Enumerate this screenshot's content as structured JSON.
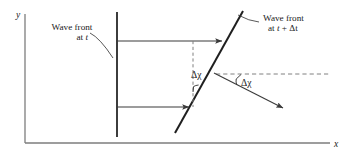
{
  "figure": {
    "kind": "physics-diagram",
    "background_color": "#ffffff",
    "line_color": "#3a3a3a",
    "dark_line_color": "#1a1a1a",
    "text_color": "#1a1a1a"
  },
  "axes": {
    "y_label": "y",
    "x_label": "x",
    "y_axis": {
      "x": 25,
      "y_top": 14,
      "y_bottom": 143
    },
    "x_axis": {
      "y": 143,
      "x_left": 25,
      "x_right": 330
    }
  },
  "labels": {
    "wavefront_t": {
      "line1": "Wave front",
      "line2_prefix": "at ",
      "line2_var": "t",
      "x": 73,
      "y": 30
    },
    "wavefront_t_dt": {
      "line1": "Wave front",
      "line2_prefix": "at ",
      "line2_var": "t",
      "line2_suffix": " + Δt",
      "x": 292,
      "y": 20
    },
    "angle_left": {
      "text": "Δχ",
      "x": 192,
      "y": 77
    },
    "angle_right": {
      "text": "Δχ",
      "x": 243,
      "y": 85
    }
  },
  "geometry": {
    "wavefront_vertical": {
      "x": 117,
      "y_top": 12,
      "y_bottom": 137
    },
    "wavefront_slanted": {
      "x1": 175,
      "y1": 133,
      "x2": 243,
      "y2": 11
    },
    "ray_upper": {
      "x1": 117,
      "y1": 41,
      "x2": 225,
      "y2": 41
    },
    "ray_lower": {
      "x1": 117,
      "y1": 107,
      "x2": 192,
      "y2": 107
    },
    "dashed_vertical": {
      "x": 193,
      "y_top": 41,
      "y_bottom": 107
    },
    "dashed_horizontal": {
      "y": 74,
      "x1": 216,
      "x2": 330
    },
    "diagonal_arrow": {
      "x1": 216,
      "y1": 74,
      "x2": 286,
      "y2": 110
    },
    "leader_left": {
      "x1": 92,
      "y1": 33,
      "x2": 112,
      "y2": 58
    },
    "leader_right": {
      "x1": 258,
      "y1": 22,
      "x2": 237,
      "y2": 15
    }
  }
}
